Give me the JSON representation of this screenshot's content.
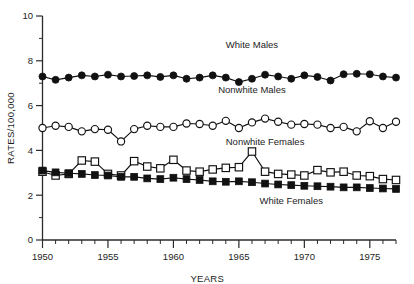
{
  "chart_data": {
    "type": "line",
    "title": "",
    "xlabel": "YEARS",
    "ylabel": "RATES/100,000",
    "xlim": [
      1950,
      1977
    ],
    "ylim": [
      0,
      10
    ],
    "grid": false,
    "legend_position": "inline-annotations",
    "y_ticks_major": [
      0,
      2,
      4,
      6,
      8,
      10
    ],
    "y_tick_labels": [
      "0",
      "2",
      "4",
      "6",
      "8",
      "10"
    ],
    "y_ticks_minor": [
      1,
      3,
      5,
      7,
      9
    ],
    "x_ticks_major": [
      1950,
      1955,
      1960,
      1965,
      1970,
      1975
    ],
    "x_tick_labels": [
      "1950",
      "1955",
      "1960",
      "1965",
      "1970",
      "1975"
    ],
    "x_ticks_minor": [
      1951,
      1952,
      1953,
      1954,
      1956,
      1957,
      1958,
      1959,
      1961,
      1962,
      1963,
      1964,
      1966,
      1967,
      1968,
      1969,
      1971,
      1972,
      1973,
      1974,
      1976,
      1977
    ],
    "x": [
      1950,
      1951,
      1952,
      1953,
      1954,
      1955,
      1956,
      1957,
      1958,
      1959,
      1960,
      1961,
      1962,
      1963,
      1964,
      1965,
      1966,
      1967,
      1968,
      1969,
      1970,
      1971,
      1972,
      1973,
      1974,
      1975,
      1976,
      1977
    ],
    "series": [
      {
        "name": "White Males",
        "marker": "filled-circle",
        "annotation_year": 1966,
        "annotation_value": 8.55,
        "values": [
          7.3,
          7.15,
          7.25,
          7.35,
          7.3,
          7.38,
          7.3,
          7.32,
          7.35,
          7.28,
          7.35,
          7.2,
          7.25,
          7.35,
          7.25,
          7.05,
          7.2,
          7.38,
          7.3,
          7.2,
          7.35,
          7.28,
          7.12,
          7.4,
          7.42,
          7.4,
          7.3,
          7.25
        ]
      },
      {
        "name": "Nonwhite Males",
        "marker": "open-circle",
        "annotation_year": 1966,
        "annotation_value": 6.55,
        "values": [
          5.0,
          5.1,
          5.05,
          4.85,
          4.95,
          4.92,
          4.4,
          4.95,
          5.1,
          5.05,
          5.05,
          5.2,
          5.18,
          5.1,
          5.32,
          5.0,
          5.25,
          5.42,
          5.28,
          5.15,
          5.18,
          5.15,
          5.0,
          5.05,
          4.85,
          5.3,
          5.0,
          5.28
        ]
      },
      {
        "name": "Nonwhite Females",
        "marker": "open-square",
        "annotation_year": 1967,
        "annotation_value": 4.25,
        "values": [
          3.05,
          2.88,
          2.95,
          3.55,
          3.5,
          2.95,
          2.88,
          3.52,
          3.28,
          3.2,
          3.58,
          3.1,
          3.05,
          3.15,
          3.22,
          3.25,
          3.95,
          3.05,
          2.95,
          2.92,
          2.88,
          3.12,
          3.02,
          3.05,
          2.88,
          2.85,
          2.72,
          2.68
        ]
      },
      {
        "name": "White Females",
        "marker": "filled-square",
        "annotation_year": 1969,
        "annotation_value": 1.62,
        "values": [
          3.1,
          3.02,
          2.98,
          2.95,
          2.9,
          2.88,
          2.82,
          2.82,
          2.75,
          2.72,
          2.78,
          2.72,
          2.68,
          2.62,
          2.6,
          2.62,
          2.58,
          2.52,
          2.48,
          2.45,
          2.42,
          2.4,
          2.38,
          2.35,
          2.35,
          2.32,
          2.3,
          2.28
        ]
      }
    ]
  }
}
